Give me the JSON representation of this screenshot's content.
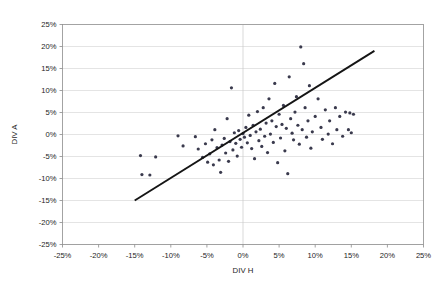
{
  "chart_data": {
    "type": "scatter",
    "title": "",
    "xlabel": "DIV H",
    "ylabel": "DIV A",
    "xlim": [
      -25,
      25
    ],
    "ylim": [
      -25,
      25
    ],
    "xticks": [
      "-25%",
      "-20%",
      "-15%",
      "-10%",
      "-5%",
      "0%",
      "5%",
      "10%",
      "15%",
      "20%",
      "25%"
    ],
    "yticks": [
      "25%",
      "20%",
      "15%",
      "10%",
      "5%",
      "0%",
      "-5%",
      "-10%",
      "-15%",
      "-20%",
      "-25%"
    ],
    "xtick_values": [
      -25,
      -20,
      -15,
      -10,
      -5,
      0,
      5,
      10,
      15,
      20,
      25
    ],
    "ytick_values": [
      25,
      20,
      15,
      10,
      5,
      0,
      -5,
      -10,
      -15,
      -20,
      -25
    ],
    "grid": "horizontal",
    "legend": "none",
    "unit": "percent",
    "marker_color": "#3a3a4d",
    "marker_size": 1.6,
    "series": [
      {
        "name": "DIV A vs DIV H",
        "points": [
          [
            -14.2,
            -4.8
          ],
          [
            -12.1,
            -5.1
          ],
          [
            -14.0,
            -9.1
          ],
          [
            -12.9,
            -9.2
          ],
          [
            -9.0,
            -0.3
          ],
          [
            -8.3,
            -2.6
          ],
          [
            -6.6,
            -0.5
          ],
          [
            -6.2,
            -3.3
          ],
          [
            -5.6,
            -5.2
          ],
          [
            -5.2,
            -2.1
          ],
          [
            -4.9,
            -6.3
          ],
          [
            -4.6,
            -4.4
          ],
          [
            -4.3,
            -1.2
          ],
          [
            -4.1,
            -6.9
          ],
          [
            -3.9,
            1.1
          ],
          [
            -3.6,
            -3.0
          ],
          [
            -3.3,
            -5.8
          ],
          [
            -3.1,
            -8.6
          ],
          [
            -2.9,
            -2.4
          ],
          [
            -2.6,
            -0.9
          ],
          [
            -2.4,
            -4.2
          ],
          [
            -2.2,
            3.6
          ],
          [
            -2.0,
            -6.1
          ],
          [
            -1.8,
            -1.6
          ],
          [
            -1.6,
            10.6
          ],
          [
            -1.4,
            -3.5
          ],
          [
            -1.2,
            0.4
          ],
          [
            -1.0,
            -2.0
          ],
          [
            -0.8,
            -4.9
          ],
          [
            -0.6,
            0.9
          ],
          [
            -0.4,
            -1.1
          ],
          [
            -0.2,
            -2.9
          ],
          [
            0.0,
            0.2
          ],
          [
            0.2,
            -0.6
          ],
          [
            0.4,
            1.6
          ],
          [
            0.6,
            -1.9
          ],
          [
            0.8,
            4.4
          ],
          [
            1.0,
            -0.2
          ],
          [
            1.2,
            -3.2
          ],
          [
            1.4,
            2.1
          ],
          [
            1.6,
            -5.5
          ],
          [
            1.8,
            0.6
          ],
          [
            2.0,
            5.2
          ],
          [
            2.2,
            -1.4
          ],
          [
            2.4,
            1.2
          ],
          [
            2.6,
            -2.7
          ],
          [
            2.8,
            6.1
          ],
          [
            3.0,
            -0.4
          ],
          [
            3.2,
            2.6
          ],
          [
            3.4,
            -4.1
          ],
          [
            3.6,
            8.1
          ],
          [
            3.8,
            0.1
          ],
          [
            4.0,
            3.1
          ],
          [
            4.2,
            -1.8
          ],
          [
            4.4,
            11.6
          ],
          [
            4.6,
            1.8
          ],
          [
            4.8,
            -6.4
          ],
          [
            5.0,
            4.6
          ],
          [
            5.2,
            -0.8
          ],
          [
            5.4,
            2.3
          ],
          [
            5.6,
            6.6
          ],
          [
            5.8,
            -3.7
          ],
          [
            6.0,
            1.4
          ],
          [
            6.2,
            -8.9
          ],
          [
            6.4,
            13.1
          ],
          [
            6.6,
            3.6
          ],
          [
            6.8,
            0.3
          ],
          [
            7.0,
            -1.2
          ],
          [
            7.2,
            5.1
          ],
          [
            7.4,
            8.6
          ],
          [
            7.6,
            2.1
          ],
          [
            7.8,
            -2.2
          ],
          [
            8.0,
            19.9
          ],
          [
            8.2,
            1.1
          ],
          [
            8.4,
            16.1
          ],
          [
            8.6,
            6.1
          ],
          [
            8.8,
            -0.6
          ],
          [
            9.0,
            3.1
          ],
          [
            9.2,
            11.1
          ],
          [
            9.4,
            -3.1
          ],
          [
            9.6,
            0.6
          ],
          [
            10.0,
            4.1
          ],
          [
            10.4,
            8.1
          ],
          [
            10.8,
            1.6
          ],
          [
            11.0,
            -1.1
          ],
          [
            11.4,
            5.6
          ],
          [
            11.8,
            0.1
          ],
          [
            12.0,
            3.1
          ],
          [
            12.4,
            -2.1
          ],
          [
            12.8,
            6.1
          ],
          [
            13.0,
            1.1
          ],
          [
            13.4,
            4.1
          ],
          [
            13.8,
            -0.4
          ],
          [
            14.2,
            5.1
          ],
          [
            14.6,
            1.1
          ],
          [
            14.8,
            4.9
          ],
          [
            15.0,
            0.4
          ],
          [
            15.3,
            4.6
          ]
        ]
      }
    ],
    "trendline": {
      "x0": -15.0,
      "y0": -15.0,
      "x1": 18.2,
      "y1": 19.0,
      "color": "#151515"
    }
  }
}
